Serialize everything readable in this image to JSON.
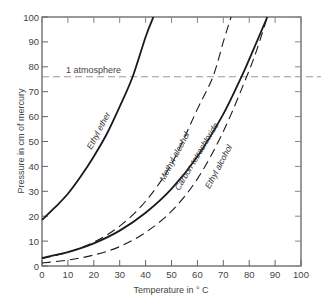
{
  "chart_data": {
    "type": "line",
    "title": "",
    "xlabel": "Temperature in ° C",
    "ylabel": "Pressure in cm of mercury",
    "xlim": [
      0,
      100
    ],
    "ylim": [
      0,
      100
    ],
    "x_ticks": [
      0,
      10,
      20,
      30,
      40,
      50,
      60,
      70,
      80,
      90,
      100
    ],
    "y_ticks": [
      0,
      10,
      20,
      30,
      40,
      50,
      60,
      70,
      80,
      90,
      100
    ],
    "grid": false,
    "legend": "none (curves labeled inline)",
    "series": [
      {
        "name": "Ethyl ether",
        "style": "solid",
        "x": [
          0,
          5,
          10,
          15,
          20,
          25,
          30,
          35,
          40,
          43
        ],
        "y": [
          18.5,
          23.5,
          29,
          36,
          44,
          53,
          64,
          76,
          92,
          100
        ]
      },
      {
        "name": "Methyl alcohol",
        "style": "dashed",
        "x": [
          0,
          10,
          20,
          30,
          40,
          50,
          60,
          66,
          70,
          73
        ],
        "y": [
          3.0,
          5.5,
          9.6,
          16,
          26,
          41,
          63,
          76,
          90,
          100
        ]
      },
      {
        "name": "Carbon tetrachloride",
        "style": "solid",
        "x": [
          0,
          10,
          20,
          30,
          40,
          50,
          60,
          70,
          77,
          80,
          87
        ],
        "y": [
          3.3,
          5.6,
          9.1,
          14.2,
          21.4,
          31,
          44,
          61,
          76,
          83,
          100
        ]
      },
      {
        "name": "Ethyl alcohol",
        "style": "dashed",
        "x": [
          0,
          10,
          20,
          30,
          40,
          50,
          60,
          70,
          79,
          83,
          87
        ],
        "y": [
          1.2,
          2.4,
          4.4,
          7.8,
          13.5,
          22,
          35,
          54,
          76,
          87,
          100
        ]
      }
    ],
    "annotations": [
      {
        "type": "hline",
        "y": 76,
        "style": "dashed",
        "label": "1 atmosphere"
      }
    ]
  },
  "labels": {
    "xlabel": "Temperature in ° C",
    "ylabel": "Pressure in cm of mercury",
    "atm": "1 atmosphere",
    "ethyl_ether": "Ethyl ether",
    "methyl_alcohol": "Methyl alcohol",
    "carbon_tet": "Carbon tetrachloride",
    "ethyl_alcohol": "Ethyl alcohol"
  }
}
